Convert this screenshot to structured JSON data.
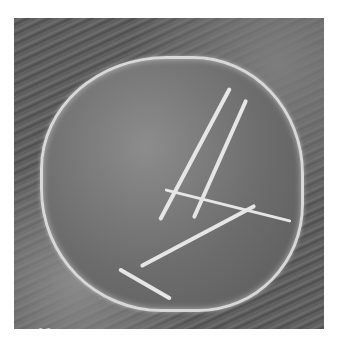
{
  "image": {
    "subject": "scanning electron micrograph of a pollen grain / cell on textured surface",
    "figure_number": "19",
    "credit": "copyright Larry Fritz",
    "colors": {
      "background": "#ffffff",
      "photo_base": "#5e5e5e",
      "ridge": "#e6e6e6",
      "caption": "#ffffff"
    }
  }
}
